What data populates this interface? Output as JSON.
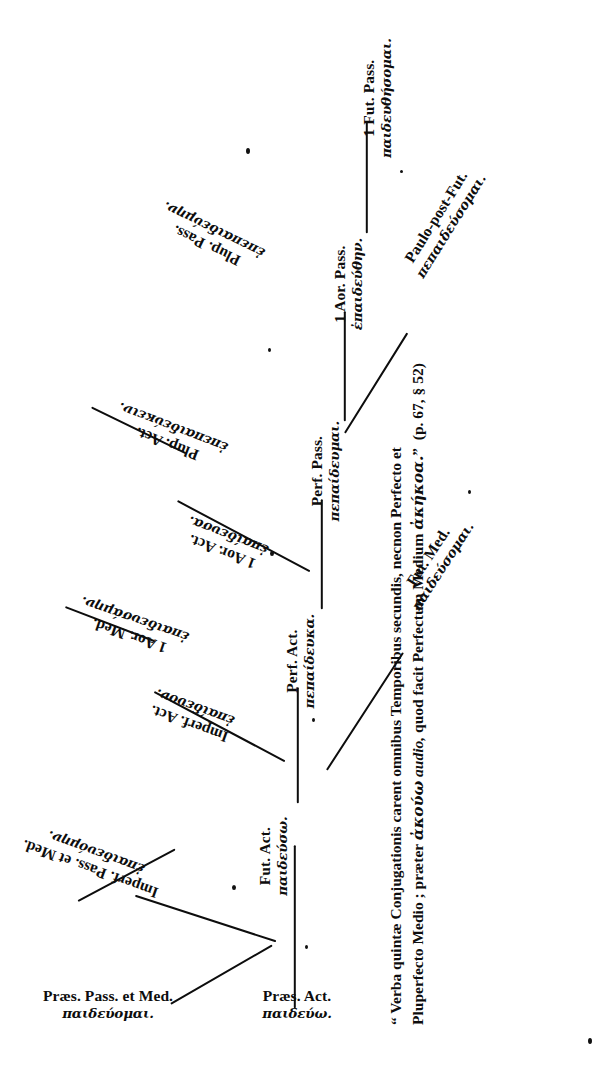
{
  "document": {
    "type": "greek-verb-tense-tree",
    "orientation": "rotated-90-counterclockwise",
    "background_color": "#ffffff",
    "ink_color": "#0d0d0d"
  },
  "nodes": [
    {
      "id": "praes-act",
      "latin": "Præs. Act.",
      "greek": "παιδεύω."
    },
    {
      "id": "praes-pass-med",
      "latin": "Præs. Pass. et Med.",
      "greek": "παιδεύομαι."
    },
    {
      "id": "imperf-act",
      "latin": "Imperf. Act.",
      "greek": "ἐπαίδευον."
    },
    {
      "id": "imperf-pass-med",
      "latin": "Imperf. Pass. et Med.",
      "greek": "ἐπαιδευόμην."
    },
    {
      "id": "fut-act",
      "latin": "Fut. Act.",
      "greek": "παιδεύσω."
    },
    {
      "id": "fut-med",
      "latin": "Fut. Med.",
      "greek": "παιδεύσομαι."
    },
    {
      "id": "aor1-act",
      "latin": "1 Aor. Act.",
      "greek": "ἐπαίδευσα."
    },
    {
      "id": "aor1-med",
      "latin": "1 Aor. Med.",
      "greek": "ἐπαιδευσάμην."
    },
    {
      "id": "perf-act",
      "latin": "Perf. Act.",
      "greek": "πεπαίδευκα."
    },
    {
      "id": "perf-pass",
      "latin": "Perf. Pass.",
      "greek": "πεπαίδευμαι."
    },
    {
      "id": "plup-act",
      "latin": "Plup. Act.",
      "greek": "ἐπεπαιδεύκειν."
    },
    {
      "id": "plup-pass",
      "latin": "Plup. Pass.",
      "greek": "ἐπεπαιδεύμην."
    },
    {
      "id": "aor1-pass",
      "latin": "1 Aor. Pass.",
      "greek": "ἐπαιδεύθην."
    },
    {
      "id": "fut1-pass",
      "latin": "1 Fut. Pass.",
      "greek": "παιδευθήσομαι."
    },
    {
      "id": "paulo-post-fut",
      "latin": "Paulo-post-Fut.",
      "greek": "πεπαιδεύσομαι."
    }
  ],
  "caption": {
    "line1": "“ Verba quintæ Conjugationis carent omnibus Temporibus secundis, necnon Perfecto et",
    "line2_a": "Pluperfecto Medio ; præter ",
    "line2_greek1": "ἀκούω",
    "line2_b": " ",
    "line2_italic": "audio,",
    "line2_c": " quod facit Perfectum Medium ",
    "line2_greek2": "ἀκήκοα.",
    "line2_d": "”",
    "line2_ref": "(p. 67, § 52)"
  }
}
